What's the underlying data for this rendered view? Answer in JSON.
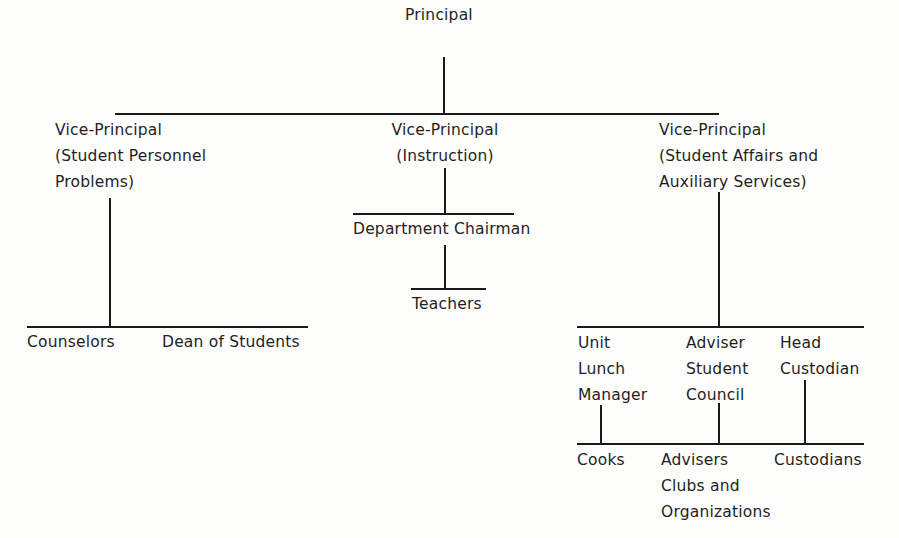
{
  "chart": {
    "root": {
      "label": "Principal"
    },
    "vice_principals": [
      {
        "lines": [
          "Vice-Principal",
          "(Student Personnel",
          "Problems)"
        ],
        "reports": [
          {
            "label": "Counselors"
          },
          {
            "label": "Dean of Students"
          }
        ]
      },
      {
        "lines": [
          "Vice-Principal",
          "(Instruction)"
        ],
        "reports": [
          {
            "label": "Department Chairman",
            "reports": [
              {
                "label": "Teachers"
              }
            ]
          }
        ]
      },
      {
        "lines": [
          "Vice-Principal",
          "(Student Affairs and",
          "Auxiliary  Services)"
        ],
        "reports": [
          {
            "lines": [
              "Unit",
              "Lunch",
              "Manager"
            ],
            "reports": [
              {
                "lines": [
                  "Cooks"
                ]
              }
            ]
          },
          {
            "lines": [
              "Adviser",
              "Student",
              "Council"
            ],
            "reports": [
              {
                "lines": [
                  "Advisers",
                  "Clubs and",
                  "Organizations"
                ]
              }
            ]
          },
          {
            "lines": [
              "Head",
              "Custodian"
            ],
            "reports": [
              {
                "lines": [
                  "Custodians"
                ]
              }
            ]
          }
        ]
      }
    ]
  },
  "colors": {
    "line": "#1a1a1a",
    "text": "#1f1f1f",
    "background": "#fdfdfc"
  }
}
